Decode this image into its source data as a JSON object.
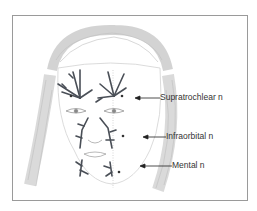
{
  "figure": {
    "labels": [
      {
        "id": "supratrochlear",
        "text": "Supratrochlear n"
      },
      {
        "id": "infraorbital",
        "text": "Infraorbital n"
      },
      {
        "id": "mental",
        "text": "Mental n"
      }
    ],
    "colors": {
      "frame": "#9a9a9a",
      "nerve": "#4a4f57",
      "hair": "#b5b5b5",
      "label_text": "#333333",
      "arrow": "#222222"
    }
  }
}
